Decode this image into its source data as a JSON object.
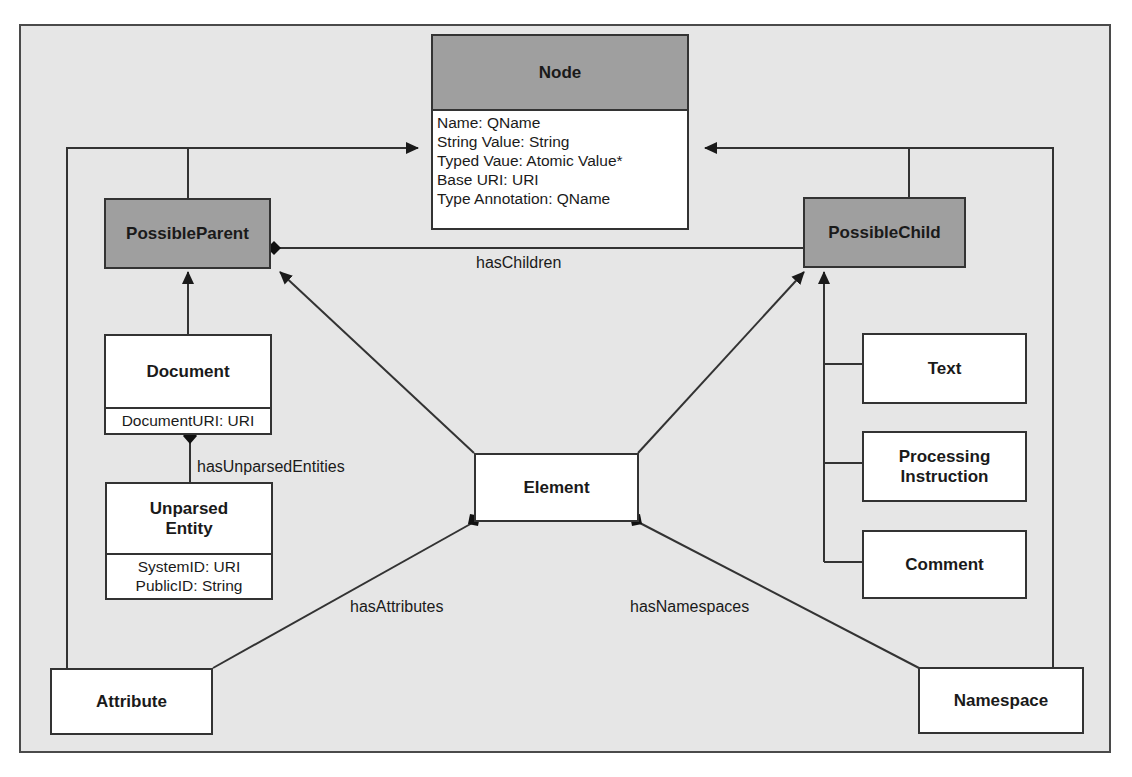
{
  "diagram": {
    "type": "UML class diagram",
    "classes": {
      "node": {
        "name": "Node",
        "abstract": true,
        "attributes": [
          "Name: QName",
          "String Value: String",
          "Typed Vaue: Atomic Value*",
          "Base URI: URI",
          "Type Annotation: QName"
        ]
      },
      "possible_parent": {
        "name": "PossibleParent",
        "abstract": true
      },
      "possible_child": {
        "name": "PossibleChild",
        "abstract": true
      },
      "document": {
        "name": "Document",
        "attributes": [
          "DocumentURI: URI"
        ]
      },
      "unparsed_entity": {
        "name_line1": "Unparsed",
        "name_line2": "Entity",
        "attributes": [
          "SystemID: URI",
          "PublicID: String"
        ]
      },
      "element": {
        "name": "Element"
      },
      "text": {
        "name": "Text"
      },
      "processing_instruction": {
        "name_line1": "Processing",
        "name_line2": "Instruction"
      },
      "comment": {
        "name": "Comment"
      },
      "attribute": {
        "name": "Attribute"
      },
      "namespace": {
        "name": "Namespace"
      }
    },
    "associations": {
      "has_children": "hasChildren",
      "has_unparsed_entities": "hasUnparsedEntities",
      "has_attributes": "hasAttributes",
      "has_namespaces": "hasNamespaces"
    },
    "colors": {
      "background": "#e6e6e6",
      "abstract_fill": "#9f9f9f",
      "concrete_fill": "#ffffff",
      "line": "#333333"
    }
  }
}
